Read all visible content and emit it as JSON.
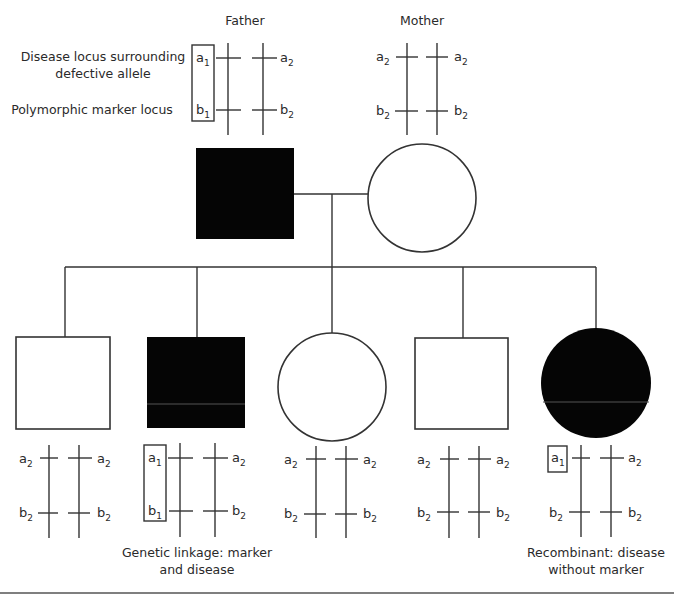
{
  "colors": {
    "affected": "#050505",
    "unaffected": "#ffffff",
    "line": "#333333",
    "text": "#2a2a2a"
  },
  "parents": {
    "father": {
      "title": "Father",
      "sex": "male",
      "affected": true,
      "chromosomes": [
        {
          "top": {
            "base": "a",
            "sub": "1"
          },
          "bottom": {
            "base": "b",
            "sub": "1"
          }
        },
        {
          "top": {
            "base": "a",
            "sub": "2"
          },
          "bottom": {
            "base": "b",
            "sub": "2"
          }
        }
      ],
      "boxed": "haplotype a1-b1"
    },
    "mother": {
      "title": "Mother",
      "sex": "female",
      "affected": false,
      "chromosomes": [
        {
          "top": {
            "base": "a",
            "sub": "2"
          },
          "bottom": {
            "base": "b",
            "sub": "2"
          }
        },
        {
          "top": {
            "base": "a",
            "sub": "2"
          },
          "bottom": {
            "base": "b",
            "sub": "2"
          }
        }
      ]
    }
  },
  "locus_labels": {
    "disease_line1": "Disease locus surrounding",
    "disease_line2": "defective allele",
    "marker": "Polymorphic marker locus"
  },
  "children": [
    {
      "sex": "male",
      "affected": false,
      "chromosomes": [
        {
          "top": {
            "base": "a",
            "sub": "2"
          },
          "bottom": {
            "base": "b",
            "sub": "2"
          }
        },
        {
          "top": {
            "base": "a",
            "sub": "2"
          },
          "bottom": {
            "base": "b",
            "sub": "2"
          }
        }
      ]
    },
    {
      "sex": "male",
      "affected": true,
      "chromosomes": [
        {
          "top": {
            "base": "a",
            "sub": "1"
          },
          "bottom": {
            "base": "b",
            "sub": "1"
          }
        },
        {
          "top": {
            "base": "a",
            "sub": "2"
          },
          "bottom": {
            "base": "b",
            "sub": "2"
          }
        }
      ],
      "caption_line1": "Genetic linkage: marker",
      "caption_line2": "and disease"
    },
    {
      "sex": "female",
      "affected": false,
      "chromosomes": [
        {
          "top": {
            "base": "a",
            "sub": "2"
          },
          "bottom": {
            "base": "b",
            "sub": "2"
          }
        },
        {
          "top": {
            "base": "a",
            "sub": "2"
          },
          "bottom": {
            "base": "b",
            "sub": "2"
          }
        }
      ]
    },
    {
      "sex": "male",
      "affected": false,
      "chromosomes": [
        {
          "top": {
            "base": "a",
            "sub": "2"
          },
          "bottom": {
            "base": "b",
            "sub": "2"
          }
        },
        {
          "top": {
            "base": "a",
            "sub": "2"
          },
          "bottom": {
            "base": "b",
            "sub": "2"
          }
        }
      ]
    },
    {
      "sex": "female",
      "affected": true,
      "chromosomes": [
        {
          "top": {
            "base": "a",
            "sub": "1"
          },
          "bottom": {
            "base": "b",
            "sub": "2"
          }
        },
        {
          "top": {
            "base": "a",
            "sub": "2"
          },
          "bottom": {
            "base": "b",
            "sub": "2"
          }
        }
      ],
      "caption_line1": "Recombinant: disease",
      "caption_line2": "without marker"
    }
  ]
}
